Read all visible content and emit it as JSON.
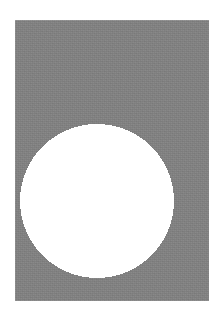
{
  "scene": {
    "title": "Abstract geometric composition",
    "canvas": {
      "width": 224,
      "height": 316,
      "background_color": "#ffffff"
    },
    "shapes": [
      {
        "name": "gray-rectangle",
        "kind": "rectangle",
        "fill_color": "#808080",
        "x": 15,
        "y": 20,
        "width": 194,
        "height": 281,
        "texture": "fine grain / paper noise",
        "label": "Gray rectangular field"
      },
      {
        "name": "white-circle",
        "kind": "circle",
        "fill_color": "#ffffff",
        "center_x": 97,
        "center_y": 201,
        "radius": 77,
        "edge": "hard aliased / jagged",
        "label": "White circular disc"
      }
    ],
    "margins": {
      "left": 15,
      "top": 20,
      "right": 15,
      "bottom": 15
    },
    "palette": {
      "background": "#ffffff",
      "field": "#808080",
      "disc": "#ffffff"
    }
  }
}
